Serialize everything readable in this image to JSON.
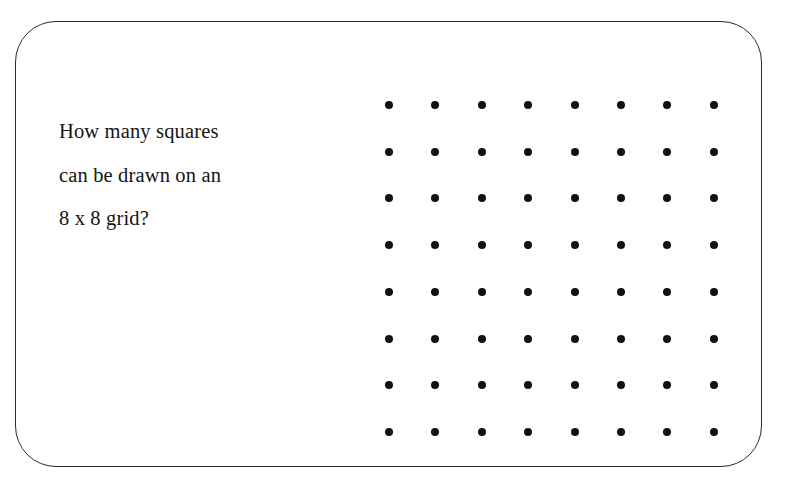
{
  "card": {
    "border_color": "#2b2b2b",
    "background_color": "#ffffff",
    "corner_radius_px": 41
  },
  "question": {
    "lines": [
      "How many squares",
      "can be drawn on an",
      "8 x 8 grid?"
    ],
    "full_text": "How many squares can be drawn on an 8 x 8 grid?",
    "text_color": "#141414"
  },
  "grid": {
    "label": "8 x 8 dot grid",
    "rows": 8,
    "columns": 8,
    "total_dots": 64,
    "dot_color": "#111111",
    "dot_diameter_px": 8,
    "column_spacing_px": 46.4,
    "row_spacing_px": 46.7,
    "first_dot_center": {
      "x": 373,
      "y": 83
    },
    "row_indices": [
      1,
      2,
      3,
      4,
      5,
      6,
      7,
      8
    ],
    "column_indices": [
      1,
      2,
      3,
      4,
      5,
      6,
      7,
      8
    ]
  }
}
